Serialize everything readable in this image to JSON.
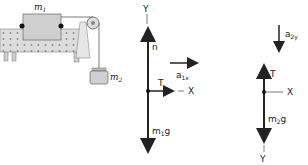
{
  "apparatus": {
    "block_label_main": "m",
    "block_label_sub": "1",
    "hanging_label_main": "m",
    "hanging_label_sub": "2"
  },
  "fbd_m1": {
    "y_axis": "Y",
    "x_axis": "X",
    "normal": "n",
    "tension": "T",
    "weight_main": "m",
    "weight_sub": "1",
    "weight_tail": "g",
    "accel_main": "a",
    "accel_sub": "1x"
  },
  "fbd_m2": {
    "y_axis": "Y",
    "x_axis": "X",
    "tension": "T",
    "weight_main": "m",
    "weight_sub": "2",
    "weight_tail": "g",
    "accel_main": "a",
    "accel_sub": "2y"
  },
  "colors": {
    "stroke": "#222222",
    "table": "#d9d9d9",
    "block": "#cfcfcf"
  }
}
